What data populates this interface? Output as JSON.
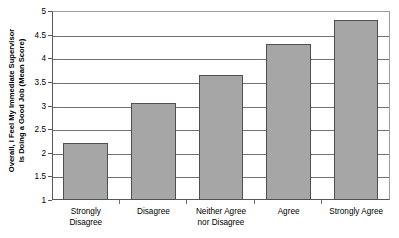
{
  "chart_data": {
    "type": "bar",
    "title": "",
    "xlabel": "",
    "ylabel": "Overall, I Feel My Immediate Supervisor Is Doing a Good Job (Mean Score)",
    "ylabel_lines": [
      "Overall, I Feel My Immediate Supervisor",
      "Is Doing a Good Job (Mean Score)"
    ],
    "categories": [
      "Strongly Disagree",
      "Disagree",
      "Neither Agree nor Disagree",
      "Agree",
      "Strongly Agree"
    ],
    "category_lines": [
      [
        "Strongly",
        "Disagree"
      ],
      [
        "Disagree",
        ""
      ],
      [
        "Neither Agree",
        "nor Disagree"
      ],
      [
        "Agree",
        ""
      ],
      [
        "Strongly Agree",
        ""
      ]
    ],
    "values": [
      2.2,
      3.05,
      3.65,
      4.3,
      4.8
    ],
    "ylim": [
      1,
      5
    ],
    "ytick_labels": [
      "5",
      "4.5",
      "4",
      "3.5",
      "3",
      "2.5",
      "2",
      "1.5",
      "1"
    ],
    "ytick_values": [
      5,
      4.5,
      4,
      3.5,
      3,
      2.5,
      2,
      1.5,
      1
    ],
    "grid": true,
    "legend": "none",
    "bar_color": "#a6a6a6",
    "bar_border_color": "#4e5154",
    "axis_color": "#55585c",
    "grid_color": "#6e7276",
    "background": "#ffffff"
  }
}
